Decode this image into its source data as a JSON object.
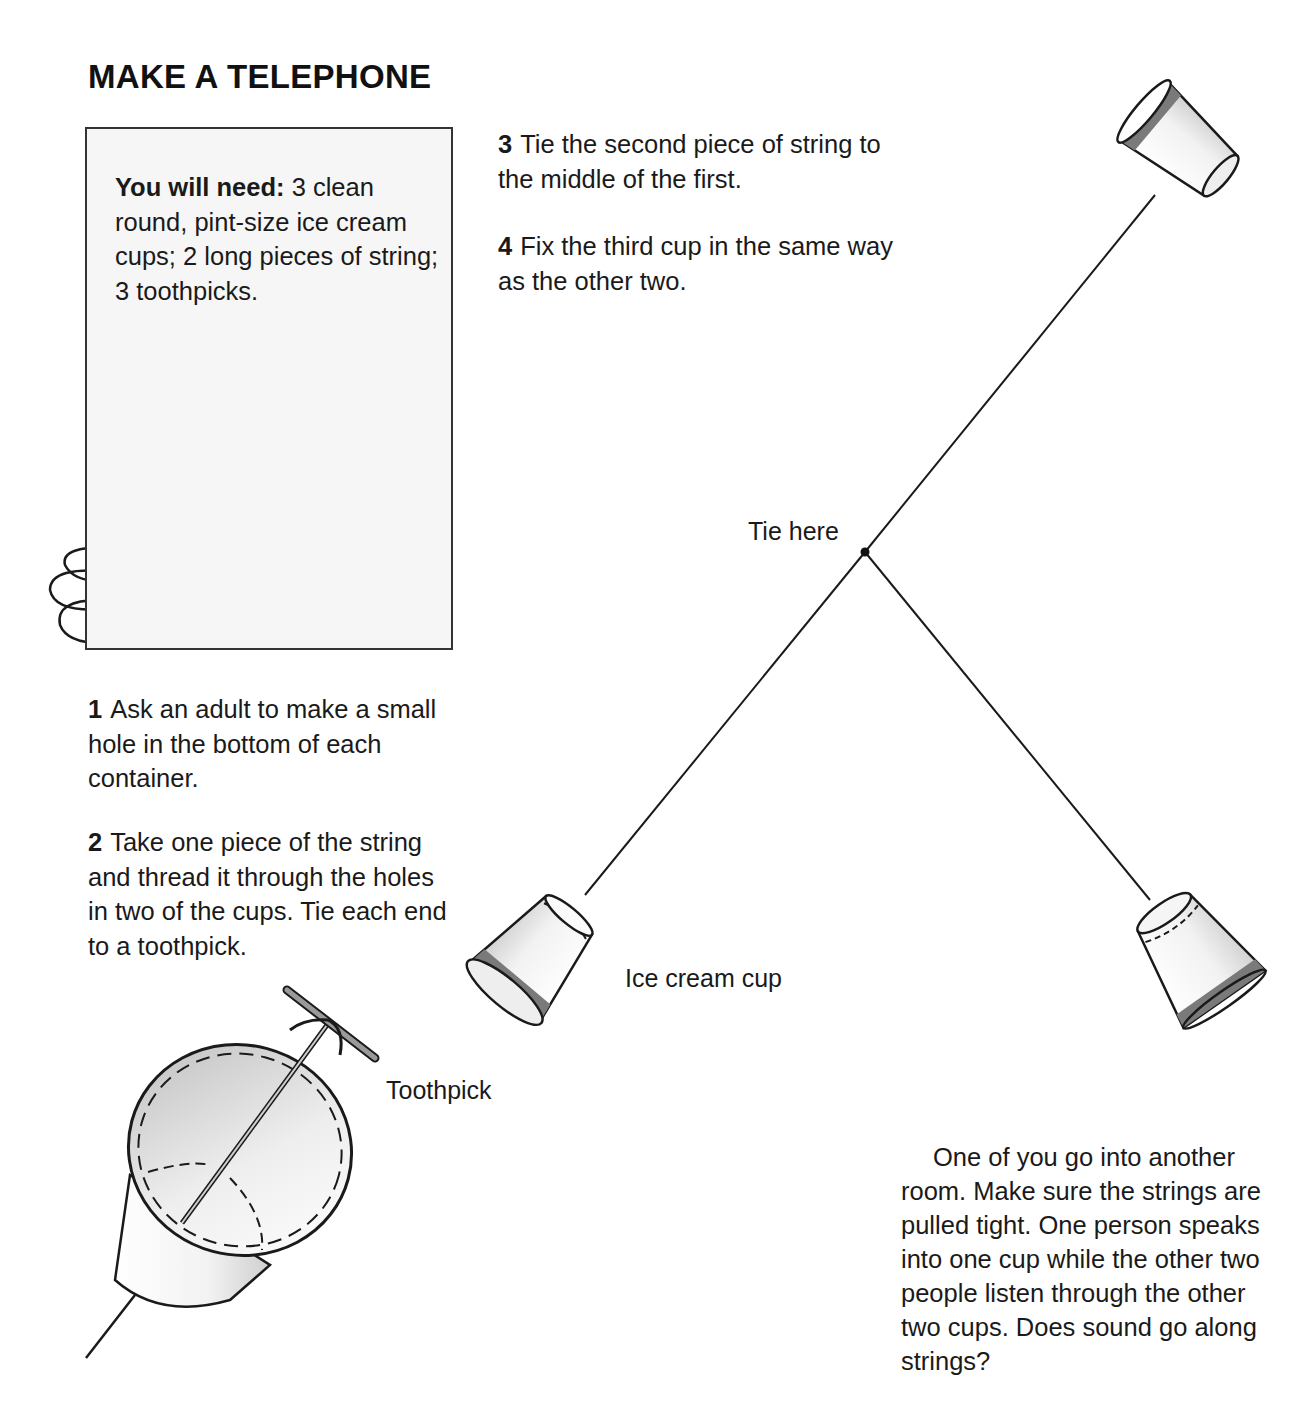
{
  "page": {
    "title": "MAKE A TELEPHONE"
  },
  "materials_box": {
    "label": "You will need:",
    "text": " 3 clean round, pint-size ice cream cups; 2 long pieces of string; 3 toothpicks.",
    "illustration": "three-cups-string-toothpicks"
  },
  "steps": [
    {
      "number": "1",
      "text": "Ask an adult to make a small hole in the bottom of each container."
    },
    {
      "number": "2",
      "text": "Take one piece of the string and thread it through the holes in two of the cups. Tie each end to a toothpick."
    },
    {
      "number": "3",
      "text": "Tie the second piece of string to the middle of the first."
    },
    {
      "number": "4",
      "text": "Fix the third cup in the same way as the other two."
    }
  ],
  "diagram": {
    "labels": {
      "tie_here": "Tie here",
      "ice_cream_cup": "Ice cream cup",
      "toothpick": "Toothpick"
    },
    "colors": {
      "line": "#1a1a1a",
      "cup_band": "#7a7a7a",
      "cup_shade": "#d9d9d9",
      "box_bg": "#f6f6f6"
    }
  },
  "closing_text": "One of you go into another room. Make sure the strings are pulled tight. One person speaks into one cup while the other two people listen through the other two cups. Does sound go along strings?"
}
